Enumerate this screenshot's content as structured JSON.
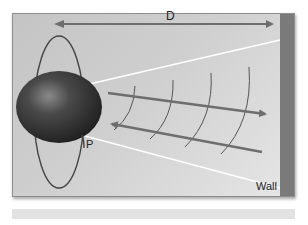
{
  "diagram": {
    "labels": {
      "distance": "D",
      "point": "P",
      "wall": "Wall"
    },
    "elements": [
      "sphere",
      "orbit-ellipse",
      "distance-arrow",
      "outgoing-wave-arrow",
      "reflected-wave-arrow",
      "wavefronts",
      "beam-cone-lines",
      "wall"
    ],
    "wavefront_count": 4,
    "colors": {
      "panel_background": "#cccccc",
      "wall": "#7a7a7a",
      "arrow": "#6e6e6e",
      "sphere": "#3a3a3a",
      "beam_lines": "#ffffff",
      "footer_bar": "#e2e2e2"
    }
  }
}
